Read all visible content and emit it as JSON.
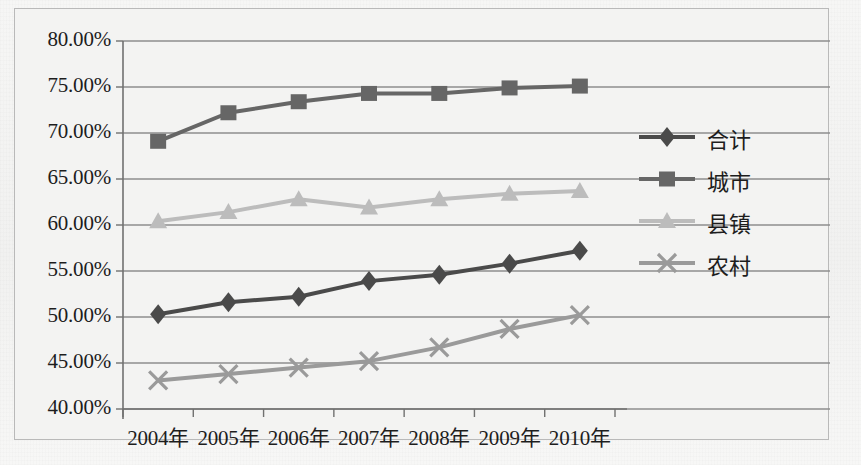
{
  "chart_data": {
    "type": "line",
    "title": "",
    "subtitle": "",
    "xlabel": "",
    "ylabel": "",
    "categories": [
      "2004年",
      "2005年",
      "2006年",
      "2007年",
      "2008年",
      "2009年",
      "2010年"
    ],
    "ylim": [
      40,
      80
    ],
    "ytick_values": [
      40,
      45,
      50,
      55,
      60,
      65,
      70,
      75,
      80
    ],
    "ytick_labels": [
      "40.00%",
      "45.00%",
      "50.00%",
      "55.00%",
      "60.00%",
      "65.00%",
      "70.00%",
      "75.00%",
      "80.00%"
    ],
    "grid": true,
    "grid_axis": "y",
    "legend_position": "right",
    "value_unit": "%",
    "series": [
      {
        "name": "合计",
        "marker": "diamond",
        "color": "#4a4a4a",
        "values": [
          50.3,
          51.6,
          52.2,
          53.9,
          54.6,
          55.8,
          57.2
        ]
      },
      {
        "name": "城市",
        "marker": "square",
        "color": "#666666",
        "values": [
          69.1,
          72.2,
          73.4,
          74.3,
          74.3,
          74.9,
          75.1
        ]
      },
      {
        "name": "县镇",
        "marker": "triangle",
        "color": "#bcbcbc",
        "values": [
          60.4,
          61.4,
          62.8,
          61.9,
          62.8,
          63.4,
          63.7
        ]
      },
      {
        "name": "农村",
        "marker": "cross",
        "color": "#9a9a9a",
        "values": [
          43.1,
          43.8,
          44.5,
          45.2,
          46.7,
          48.7,
          50.2
        ]
      }
    ]
  },
  "legend": {
    "items": [
      {
        "label": "合计",
        "marker": "diamond"
      },
      {
        "label": "城市",
        "marker": "square"
      },
      {
        "label": "县镇",
        "marker": "triangle"
      },
      {
        "label": "农村",
        "marker": "cross"
      }
    ]
  }
}
